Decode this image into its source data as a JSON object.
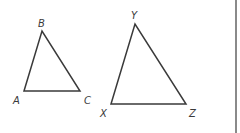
{
  "diagram": {
    "type": "geometry-similar-triangles",
    "triangles": [
      {
        "name": "ABC",
        "vertices": [
          {
            "label": "A",
            "x": 24,
            "y": 91,
            "label_x": 13,
            "label_y": 104
          },
          {
            "label": "B",
            "x": 42,
            "y": 31,
            "label_x": 38,
            "label_y": 27
          },
          {
            "label": "C",
            "x": 80,
            "y": 91,
            "label_x": 84,
            "label_y": 104
          }
        ]
      },
      {
        "name": "XYZ",
        "vertices": [
          {
            "label": "X",
            "x": 111,
            "y": 104,
            "label_x": 100,
            "label_y": 117
          },
          {
            "label": "Y",
            "x": 135,
            "y": 24,
            "label_x": 131,
            "label_y": 19
          },
          {
            "label": "Z",
            "x": 186,
            "y": 104,
            "label_x": 189,
            "label_y": 117
          }
        ]
      }
    ],
    "line_color": "#3a3a3a",
    "border_color": "#8a8a8a"
  }
}
